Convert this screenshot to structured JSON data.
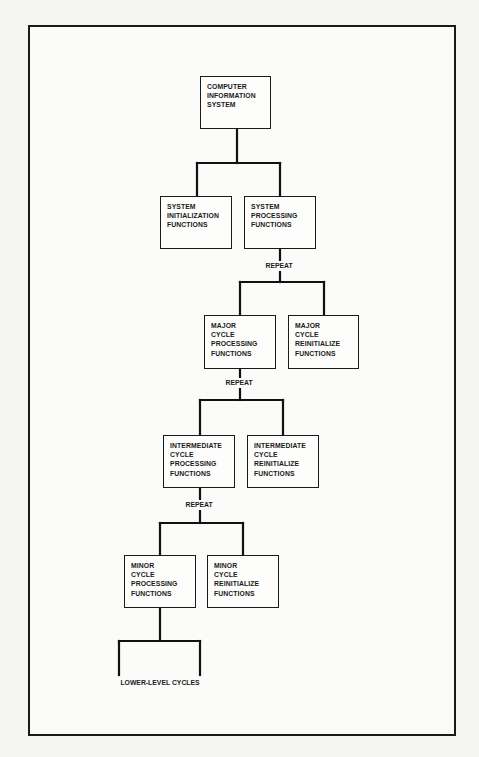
{
  "diagram": {
    "type": "hierarchy-chart",
    "root": {
      "label": "COMPUTER\nINFORMATION\nSYSTEM"
    },
    "level1": {
      "left": {
        "label": "SYSTEM\nINITIALIZATION\nFUNCTIONS"
      },
      "right": {
        "label": "SYSTEM\nPROCESSING\nFUNCTIONS"
      }
    },
    "repeat_labels": [
      "REPEAT",
      "REPEAT",
      "REPEAT"
    ],
    "level2": {
      "left": {
        "label": "MAJOR\nCYCLE\nPROCESSING\nFUNCTIONS"
      },
      "right": {
        "label": "MAJOR\nCYCLE\nREINITIALIZE\nFUNCTIONS"
      }
    },
    "level3": {
      "left": {
        "label": "INTERMEDIATE\nCYCLE\nPROCESSING\nFUNCTIONS"
      },
      "right": {
        "label": "INTERMEDIATE\nCYCLE\nREINITIALIZE\nFUNCTIONS"
      }
    },
    "level4": {
      "left": {
        "label": "MINOR\nCYCLE\nPROCESSING\nFUNCTIONS"
      },
      "right": {
        "label": "MINOR\nCYCLE\nREINITIALIZE\nFUNCTIONS"
      }
    },
    "leaf_label": "LOWER-LEVEL CYCLES"
  },
  "colors": {
    "line": "#111111",
    "background": "#fbfbfa",
    "text": "#1a1a1a"
  }
}
